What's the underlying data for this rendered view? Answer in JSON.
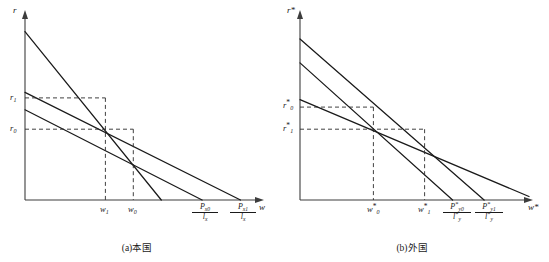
{
  "figure": {
    "panels": [
      {
        "id": "panel-a",
        "caption": "(a)本国",
        "y_axis_label": "r",
        "x_axis_label": "w",
        "y_ticks": [
          {
            "name": "r1",
            "base": "r",
            "sub": "1",
            "star": "",
            "y_value": 0.555
          },
          {
            "name": "r0",
            "base": "r",
            "sub": "0",
            "star": "",
            "y_value": 0.385
          }
        ],
        "x_ticks": [
          {
            "name": "w1",
            "base": "w",
            "sub": "1",
            "star": "",
            "x_value": 0.345
          },
          {
            "name": "w0",
            "base": "w",
            "sub": "0",
            "star": "",
            "x_value": 0.465
          }
        ],
        "x_fractions": [
          {
            "name": "Px0-over-lx",
            "num_base": "P",
            "num_sub": "x0",
            "num_star": "",
            "den_base": "l",
            "den_sub": "x",
            "den_star": "",
            "x_value": 0.76
          },
          {
            "name": "Px1-over-lx",
            "num_base": "P",
            "num_sub": "x1",
            "num_star": "",
            "den_base": "l",
            "den_sub": "x",
            "den_star": "",
            "x_value": 0.925
          }
        ],
        "lines": [
          {
            "name": "steep-line",
            "y_intercept": 0.915,
            "x_intercept": 0.585
          },
          {
            "name": "flat-line-outer",
            "y_intercept": 0.585,
            "x_intercept": 0.925
          },
          {
            "name": "flat-line-inner",
            "y_intercept": 0.49,
            "x_intercept": 0.76
          }
        ],
        "equilibria": [
          {
            "name": "equilibrium-upper",
            "x": 0.345,
            "y": 0.555
          },
          {
            "name": "equilibrium-lower",
            "x": 0.465,
            "y": 0.385
          }
        ]
      },
      {
        "id": "panel-b",
        "caption": "(b)外国",
        "y_axis_label": "r",
        "y_axis_star": "*",
        "x_axis_label": "w",
        "x_axis_star": "*",
        "y_ticks": [
          {
            "name": "r0-star",
            "base": "r",
            "sub": "0",
            "star": "*",
            "y_value": 0.505
          },
          {
            "name": "r1-star",
            "base": "r",
            "sub": "1",
            "star": "*",
            "y_value": 0.385
          }
        ],
        "x_ticks": [
          {
            "name": "w0-star",
            "base": "w",
            "sub": "0",
            "star": "*",
            "x_value": 0.315
          },
          {
            "name": "w1-star",
            "base": "w",
            "sub": "1",
            "star": "*",
            "x_value": 0.535
          }
        ],
        "x_fractions": [
          {
            "name": "Py0-star-over-ly-star",
            "num_base": "P",
            "num_sub": "y0",
            "num_star": "*",
            "den_base": "l",
            "den_sub": "y",
            "den_star": "*",
            "x_value": 0.655
          },
          {
            "name": "Py1-star-over-ly-star",
            "num_base": "P",
            "num_sub": "y1",
            "num_star": "*",
            "den_base": "l",
            "den_sub": "y",
            "den_star": "*",
            "x_value": 0.79
          }
        ],
        "lines": [
          {
            "name": "steep-line-outer",
            "y_intercept": 0.875,
            "x_intercept": 0.79
          },
          {
            "name": "steep-line-inner",
            "y_intercept": 0.745,
            "x_intercept": 0.655
          },
          {
            "name": "flat-line",
            "y_intercept": 0.545,
            "x_intercept": 1.02
          }
        ],
        "equilibria": [
          {
            "name": "equilibrium-upper",
            "x": 0.315,
            "y": 0.505
          },
          {
            "name": "equilibrium-lower",
            "x": 0.535,
            "y": 0.385
          }
        ]
      }
    ]
  }
}
